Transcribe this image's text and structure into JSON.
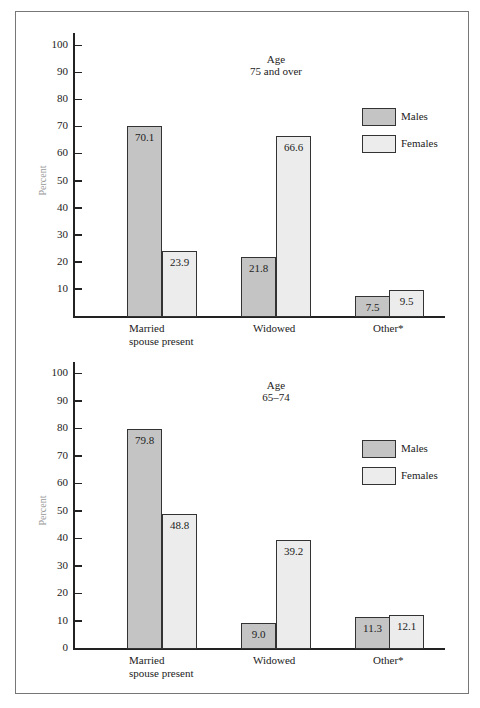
{
  "chart_data": [
    {
      "type": "bar",
      "title": "Age 75 and over",
      "title_lines": [
        "Age",
        "75 and over"
      ],
      "categories": [
        "Married spouse present",
        "Widowed",
        "Other*"
      ],
      "category_lines": [
        [
          "Married",
          "spouse present"
        ],
        [
          "Widowed"
        ],
        [
          "Other*"
        ]
      ],
      "series": [
        {
          "name": "Males",
          "values": [
            70.1,
            21.8,
            7.5
          ],
          "color": "#c4c4c4"
        },
        {
          "name": "Females",
          "values": [
            23.9,
            66.6,
            9.5
          ],
          "color": "#ececec"
        }
      ],
      "xlabel": "",
      "ylabel": "Percent",
      "ylim": [
        0,
        100
      ],
      "yticks": [
        10,
        20,
        30,
        40,
        50,
        60,
        70,
        80,
        90,
        100
      ],
      "grid": false,
      "legend_position": "upper right"
    },
    {
      "type": "bar",
      "title": "Age 65–74",
      "title_lines": [
        "Age",
        "65–74"
      ],
      "categories": [
        "Married spouse present",
        "Widowed",
        "Other*"
      ],
      "category_lines": [
        [
          "Married",
          "spouse present"
        ],
        [
          "Widowed"
        ],
        [
          "Other*"
        ]
      ],
      "series": [
        {
          "name": "Males",
          "values": [
            79.8,
            9.0,
            11.3
          ],
          "color": "#c4c4c4"
        },
        {
          "name": "Females",
          "values": [
            48.8,
            39.2,
            12.1
          ],
          "color": "#ececec"
        }
      ],
      "xlabel": "",
      "ylabel": "Percent",
      "ylim": [
        0,
        100
      ],
      "yticks": [
        0,
        10,
        20,
        30,
        40,
        50,
        60,
        70,
        80,
        90,
        100
      ],
      "grid": false,
      "legend_position": "upper right"
    }
  ],
  "value_labels": {
    "top": [
      "70.1",
      "23.9",
      "21.8",
      "66.6",
      "7.5",
      "9.5"
    ],
    "bottom": [
      "79.8",
      "48.8",
      "9.0",
      "39.2",
      "11.3",
      "12.1"
    ]
  }
}
